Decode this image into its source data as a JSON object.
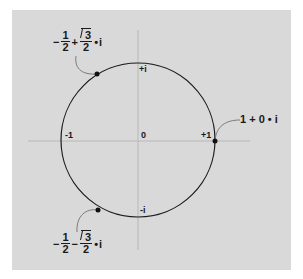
{
  "diagram": {
    "type": "unit-circle-complex-plane",
    "colors": {
      "background": "#d9d9d9",
      "stroke": "#1a1a1a",
      "axis": "#b8b8b8",
      "callout": "#8a8a8a"
    },
    "axis_labels": {
      "neg_one": "-1",
      "zero": "0",
      "pos_one": "+1",
      "pos_i": "+i",
      "neg_i": "-i"
    },
    "points": [
      {
        "name": "upper",
        "sign": "−",
        "real_num": "1",
        "real_den": "2",
        "op": "+",
        "imag_num": "3",
        "imag_den": "2",
        "dot": "•",
        "i": "i"
      },
      {
        "name": "lower",
        "sign": "−",
        "real_num": "1",
        "real_den": "2",
        "op": "−",
        "imag_num": "3",
        "imag_den": "2",
        "dot": "•",
        "i": "i"
      }
    ],
    "right_point": {
      "label": "1 + 0 • i"
    }
  }
}
